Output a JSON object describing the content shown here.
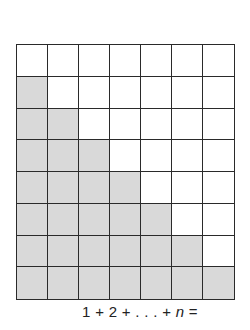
{
  "diagram": {
    "type": "triangular-number-grid",
    "columns": 7,
    "rows": 8,
    "shaded_per_row": [
      0,
      1,
      2,
      3,
      4,
      5,
      6,
      7
    ],
    "colors": {
      "shaded": "#d9d9d9",
      "unshaded": "#ffffff",
      "lines": "#2a2a2a"
    }
  },
  "caption": {
    "prefix": "1 + 2 + . . . + ",
    "variable": "n",
    "suffix": " ="
  }
}
